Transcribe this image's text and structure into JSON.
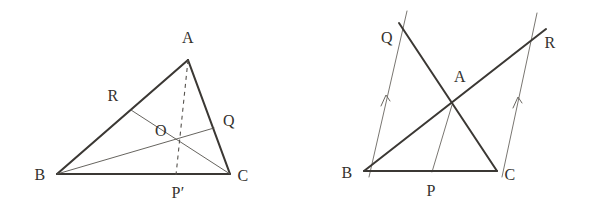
{
  "page": {
    "width": 592,
    "height": 213,
    "background_color": "#ffffff",
    "ink_color": "#3b3834",
    "thin_ink_color": "#6a6761"
  },
  "figures": [
    {
      "id": "left-figure",
      "name": "triangle-with-concurrent-cevians",
      "description": "Triangle ABC with cevians CR, BQ and dashed median-like segment AP' meeting at O",
      "vertices": {
        "A": {
          "x": 188,
          "y": 60
        },
        "B": {
          "x": 57,
          "y": 174
        },
        "C": {
          "x": 230,
          "y": 174
        }
      },
      "points": {
        "R": {
          "x": 131,
          "y": 110
        },
        "Q": {
          "x": 214,
          "y": 128
        },
        "O": {
          "x": 182,
          "y": 134
        },
        "Pprime": {
          "x": 176,
          "y": 174
        }
      },
      "labels": [
        {
          "name": "label-A",
          "text": "A",
          "x": 188,
          "y": 38
        },
        {
          "name": "label-B",
          "text": "B",
          "x": 40,
          "y": 175
        },
        {
          "name": "label-C",
          "text": "C",
          "x": 243,
          "y": 176
        },
        {
          "name": "label-R",
          "text": "R",
          "x": 113,
          "y": 96
        },
        {
          "name": "label-Q",
          "text": "Q",
          "x": 229,
          "y": 121
        },
        {
          "name": "label-O",
          "text": "O",
          "x": 161,
          "y": 131
        },
        {
          "name": "label-Pprime",
          "text": "P′",
          "x": 178,
          "y": 193
        }
      ],
      "segments": [
        {
          "name": "side-AB",
          "from": "A",
          "to": "B",
          "style": "solid",
          "weight": "thick"
        },
        {
          "name": "side-AC",
          "from": "A",
          "to": "C",
          "style": "solid",
          "weight": "thick"
        },
        {
          "name": "side-BC",
          "from": "B",
          "to": "C",
          "style": "solid",
          "weight": "thick"
        },
        {
          "name": "cevian-CR",
          "from": "C",
          "to": "R",
          "style": "solid",
          "weight": "thin"
        },
        {
          "name": "cevian-BQ",
          "from": "B",
          "to": "Q",
          "style": "solid",
          "weight": "thin"
        },
        {
          "name": "cevian-AP-prime",
          "from": "A",
          "to": "Pprime",
          "style": "dashed",
          "weight": "thin"
        }
      ]
    },
    {
      "id": "right-figure",
      "name": "triangle-with-parallel-construction",
      "description": "Triangle ABC with line BAR and line CAQ extended beyond A, segment AP to base BC, and two thin parallel rays from B and C marked with arrowheads",
      "vertices": {
        "A": {
          "x": 452,
          "y": 105
        },
        "B": {
          "x": 364,
          "y": 171
        },
        "C": {
          "x": 496,
          "y": 171
        }
      },
      "points": {
        "Q": {
          "x": 400,
          "y": 25
        },
        "R": {
          "x": 545,
          "y": 30
        },
        "P": {
          "x": 432,
          "y": 171
        }
      },
      "labels": [
        {
          "name": "label-A",
          "text": "A",
          "x": 460,
          "y": 77
        },
        {
          "name": "label-B",
          "text": "B",
          "x": 347,
          "y": 173
        },
        {
          "name": "label-C",
          "text": "C",
          "x": 510,
          "y": 175
        },
        {
          "name": "label-Q",
          "text": "Q",
          "x": 387,
          "y": 38
        },
        {
          "name": "label-R",
          "text": "R",
          "x": 550,
          "y": 43
        },
        {
          "name": "label-P",
          "text": "P",
          "x": 431,
          "y": 191
        }
      ],
      "segments": [
        {
          "name": "side-BC",
          "from": "B",
          "to": "C",
          "style": "solid",
          "weight": "thick"
        },
        {
          "name": "line-B-A-R",
          "from": "B",
          "to": "R",
          "style": "solid",
          "weight": "thick"
        },
        {
          "name": "line-C-A-Q",
          "from": "C",
          "to": "Q",
          "style": "solid",
          "weight": "thick"
        },
        {
          "name": "segment-A-P",
          "from": "A",
          "to": "P",
          "style": "solid",
          "weight": "thin"
        },
        {
          "name": "parallel-ray-from-B",
          "from": {
            "x": 369,
            "y": 176
          },
          "to": {
            "x": 407,
            "y": 12
          },
          "style": "solid",
          "weight": "thin",
          "arrow": true
        },
        {
          "name": "parallel-ray-from-C",
          "from": {
            "x": 502,
            "y": 176
          },
          "to": {
            "x": 536,
            "y": 14
          },
          "style": "solid",
          "weight": "thin",
          "arrow": true
        }
      ],
      "arrow_marks": [
        {
          "name": "parallel-arrow-left",
          "x": 385,
          "y": 99
        },
        {
          "name": "parallel-arrow-right",
          "x": 517,
          "y": 101
        }
      ]
    }
  ]
}
